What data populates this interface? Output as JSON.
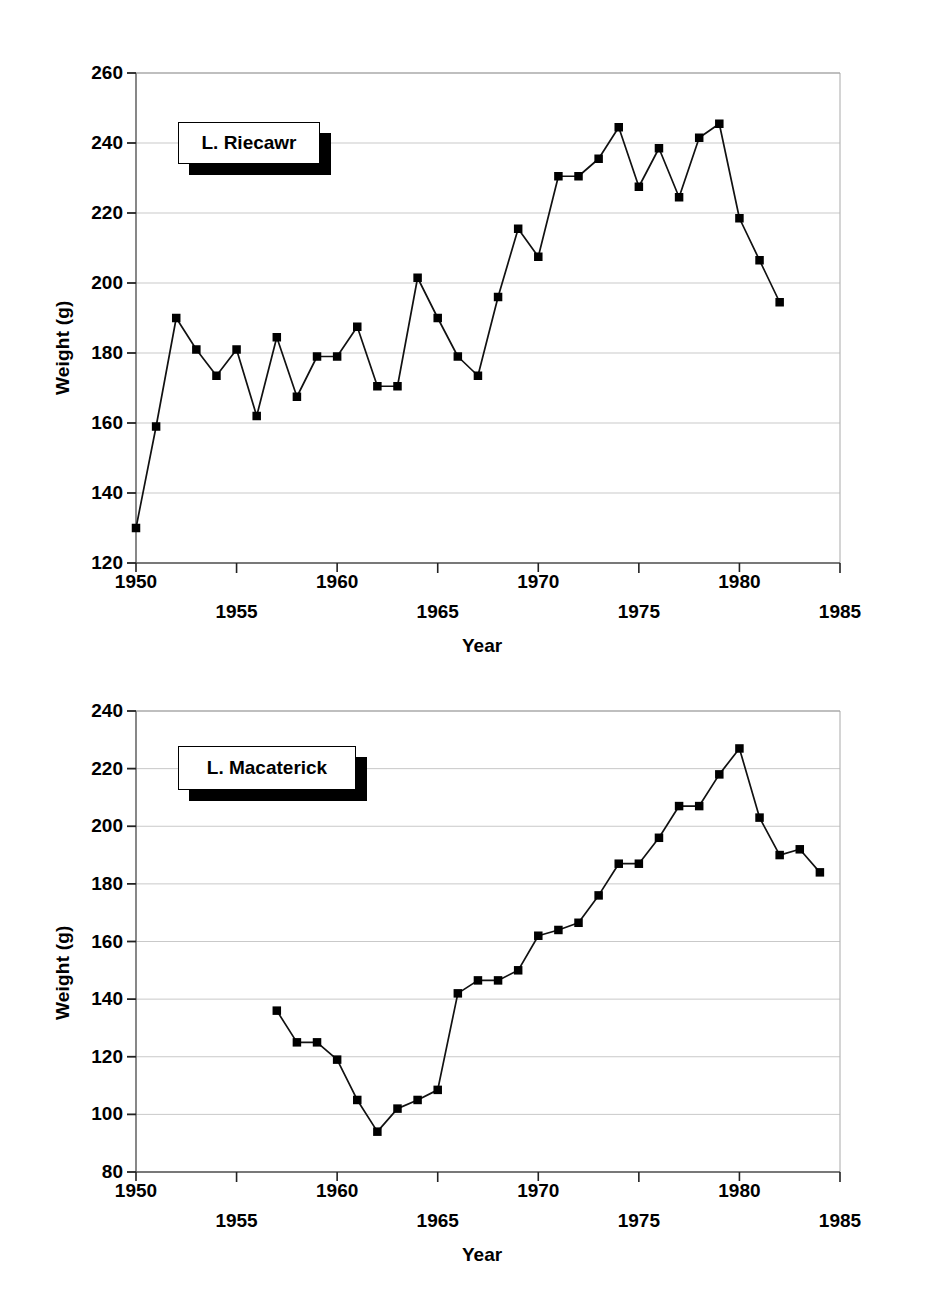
{
  "figure": {
    "panels": [
      {
        "id": "upper",
        "legend_label": "L. Riecawr",
        "xlabel": "Year",
        "ylabel": "Weight (g)",
        "yticks": [
          120,
          140,
          160,
          180,
          200,
          220,
          240,
          260
        ],
        "xticks": [
          1950,
          1955,
          1960,
          1965,
          1970,
          1975,
          1980,
          1985
        ]
      },
      {
        "id": "lower",
        "legend_label": "L. Macaterick",
        "xlabel": "Year",
        "ylabel": "Weight (g)",
        "yticks": [
          80,
          100,
          120,
          140,
          160,
          180,
          200,
          220,
          240
        ],
        "xticks": [
          1950,
          1955,
          1960,
          1965,
          1970,
          1975,
          1980,
          1985
        ]
      }
    ]
  },
  "chart_data": [
    {
      "type": "line",
      "id": "upper",
      "title": "L. Riecawr",
      "xlabel": "Year",
      "ylabel": "Weight (g)",
      "xlim": [
        1950,
        1985
      ],
      "ylim": [
        120,
        260
      ],
      "xtick_step": 5,
      "ytick_step": 20,
      "grid": true,
      "marker": "filled-square",
      "legend_position": "upper-left-inside",
      "x": [
        1950,
        1951,
        1952,
        1953,
        1954,
        1955,
        1956,
        1957,
        1958,
        1959,
        1960,
        1961,
        1962,
        1963,
        1964,
        1965,
        1966,
        1967,
        1968,
        1969,
        1970,
        1971,
        1972,
        1973,
        1974,
        1975,
        1976,
        1977,
        1978,
        1979,
        1980,
        1981,
        1982
      ],
      "values": [
        130.0,
        159.0,
        190.0,
        181.0,
        173.5,
        181.0,
        162.0,
        184.5,
        167.5,
        179.0,
        179.0,
        187.5,
        170.5,
        170.5,
        201.5,
        190.0,
        179.0,
        173.5,
        196.0,
        215.5,
        207.5,
        230.5,
        230.5,
        235.5,
        244.5,
        227.5,
        238.5,
        224.5,
        241.5,
        245.5,
        218.5,
        206.5,
        194.5
      ]
    },
    {
      "type": "line",
      "id": "lower",
      "title": "L. Macaterick",
      "xlabel": "Year",
      "ylabel": "Weight (g)",
      "xlim": [
        1950,
        1985
      ],
      "ylim": [
        80,
        240
      ],
      "xtick_step": 5,
      "ytick_step": 20,
      "grid": true,
      "marker": "filled-square",
      "legend_position": "upper-left-inside",
      "x": [
        1957,
        1958,
        1959,
        1960,
        1961,
        1962,
        1963,
        1964,
        1965,
        1966,
        1967,
        1968,
        1969,
        1970,
        1971,
        1972,
        1973,
        1974,
        1975,
        1976,
        1977,
        1978,
        1979,
        1980,
        1981,
        1982
      ],
      "values": [
        136.0,
        125.0,
        125.0,
        119.0,
        105.0,
        94.0,
        102.0,
        105.0,
        108.5,
        142.0,
        146.5,
        146.5,
        150.0,
        162.0,
        164.0,
        166.5,
        176.0,
        187.0,
        187.0,
        196.0,
        207.0,
        207.0,
        218.0,
        227.0,
        203.0,
        190.0
      ]
    },
    {
      "type": "line",
      "id": "lower-tail",
      "title": "L. Macaterick tail",
      "x": [
        1983,
        1984
      ],
      "values": [
        192.0,
        184.0
      ]
    }
  ]
}
